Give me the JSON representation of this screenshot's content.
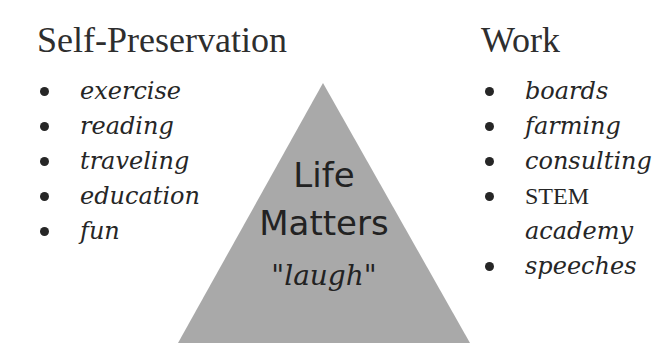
{
  "left": {
    "heading": "Self-Preservation",
    "items": [
      "exercise",
      "reading",
      "traveling",
      "education",
      "fun"
    ]
  },
  "right": {
    "heading": "Work",
    "items": [
      "boards",
      "farming",
      "consulting",
      "STEM",
      "academy",
      "speeches"
    ]
  },
  "center": {
    "line1": "Life",
    "line2": "Matters",
    "line3": "\"laugh\"",
    "fill_color": "#a9a9a9"
  }
}
